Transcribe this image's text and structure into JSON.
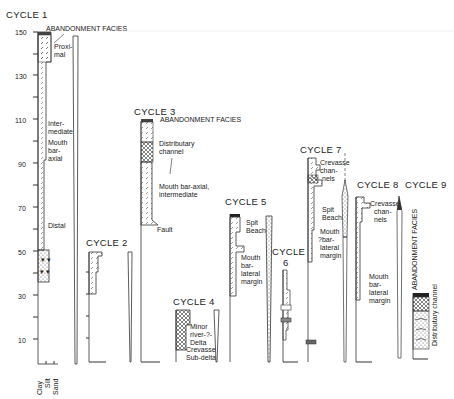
{
  "figure": {
    "type": "stratigraphic-sections",
    "axis": {
      "ticks": [
        "150",
        "130",
        "110",
        "90",
        "70",
        "50",
        "30",
        "10"
      ],
      "grain_size_labels": [
        "Clay",
        "Silt",
        "Sand"
      ]
    },
    "cycles": [
      {
        "title": "CYCLE 1",
        "labels": [
          "ABANDONMENT FACIES",
          "Proxi-",
          "mal",
          "Inter-",
          "mediate",
          "Mouth",
          "bar-",
          "axial",
          "Distal"
        ]
      },
      {
        "title": "CYCLE 2",
        "labels": []
      },
      {
        "title": "CYCLE 3",
        "labels": [
          "ABANDONMENT FACIES",
          "Distributary",
          "channel",
          "Mouth bar-axial,",
          "intermediate",
          "Fault"
        ]
      },
      {
        "title": "CYCLE 4",
        "labels": [
          "Minor",
          "river-?-",
          "Delta",
          "Crevasse",
          "Sub-delta"
        ]
      },
      {
        "title": "CYCLE 5",
        "labels": [
          "Spit",
          "Beach",
          "Mouth",
          "bar-",
          "lateral",
          "margin"
        ]
      },
      {
        "title": "CYCLE",
        "title2": "6",
        "labels": []
      },
      {
        "title": "CYCLE 7",
        "labels": [
          "Crevasse",
          "chan-",
          "nels",
          "Spit",
          "Beach",
          "Mouth",
          "?bar-",
          "lateral",
          "margin"
        ]
      },
      {
        "title": "CYCLE 8",
        "labels": [
          "Crevasse",
          "chan-",
          "nels",
          "Mouth",
          "bar-",
          "lateral",
          "margin"
        ]
      },
      {
        "title": "CYCLE 9",
        "labels": [
          "ABANDONMENT FACIES",
          "Distributary channel"
        ]
      }
    ]
  }
}
